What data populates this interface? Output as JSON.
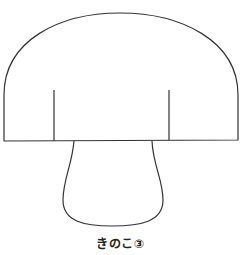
{
  "figure": {
    "caption": "きのこ③",
    "stroke_color": "#333333",
    "background": "#ffffff"
  }
}
